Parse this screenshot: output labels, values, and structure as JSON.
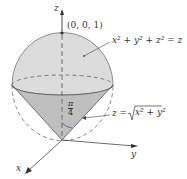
{
  "diagram": {
    "axes": {
      "z_label": "z",
      "y_label": "y",
      "x_label": "x"
    },
    "point_label": "(0, 0, 1)",
    "sphere_label": "x² + y² + z² = z",
    "cone_label_lhs": "z = ",
    "cone_label_rhs": "x² + y²",
    "angle_label_num": "π",
    "angle_label_den": "4",
    "colors": {
      "sphere_fill": "#d9d9d9",
      "cone_fill": "#bdbdbd",
      "stroke": "#555555"
    }
  }
}
